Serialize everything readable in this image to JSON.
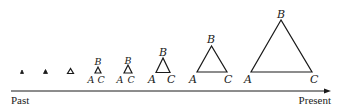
{
  "diagram": {
    "timeline": {
      "start_label": "Past",
      "end_label": "Present",
      "color": "#1a1a1a"
    },
    "vertex_labels": {
      "a": "A",
      "b": "B",
      "c": "C"
    },
    "triangles": [
      {
        "stage": 1,
        "labeled": false
      },
      {
        "stage": 2,
        "labeled": false
      },
      {
        "stage": 3,
        "labeled": false
      },
      {
        "stage": 4,
        "labeled": true,
        "labels": {
          "a": "A",
          "b": "B",
          "c": "C"
        }
      },
      {
        "stage": 5,
        "labeled": true,
        "labels": {
          "a": "A",
          "b": "B",
          "c": "C"
        }
      },
      {
        "stage": 6,
        "labeled": true,
        "labels": {
          "a": "A",
          "b": "B",
          "c": "C"
        }
      },
      {
        "stage": 7,
        "labeled": true,
        "labels": {
          "a": "A",
          "b": "B",
          "c": "C"
        }
      },
      {
        "stage": 8,
        "labeled": true,
        "labels": {
          "a": "A",
          "b": "B",
          "c": "C"
        }
      }
    ]
  }
}
